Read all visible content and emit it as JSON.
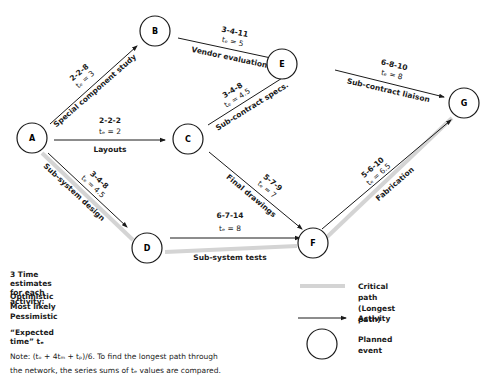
{
  "nodes": [
    {
      "id": "A",
      "label": "A"
    },
    {
      "id": "B",
      "label": "B"
    },
    {
      "id": "C",
      "label": "C"
    },
    {
      "id": "D",
      "label": "D"
    },
    {
      "id": "E",
      "label": "E"
    },
    {
      "id": "F",
      "label": "F"
    },
    {
      "id": "G",
      "label": "G"
    }
  ],
  "activities": {
    "ab": {
      "name": "Special component study",
      "estimates": "2-2-8",
      "te": "tₑ = 3"
    },
    "ac": {
      "name": "Layouts",
      "estimates": "2-2-2",
      "te": "tₑ = 2"
    },
    "ad": {
      "name": "Sub-system design",
      "estimates": "3-4-8",
      "te": "tₑ = 4.5"
    },
    "be": {
      "name": "Vendor evaluation",
      "estimates": "3-4-11",
      "te": "tₑ = 5"
    },
    "ce": {
      "name": "Sub-contract specs.",
      "estimates": "3-4-8",
      "te": "tₑ = 4.5"
    },
    "cf": {
      "name": "Final drawings",
      "estimates": "5-7-9",
      "te": "tₑ = 7"
    },
    "df": {
      "name": "Sub-system tests",
      "estimates": "6-7-14",
      "te": "tₑ = 8"
    },
    "eg": {
      "name": "Sub-contract liaison",
      "estimates": "6-8-10",
      "te": "tₑ = 8"
    },
    "fg": {
      "name": "Fabrication",
      "estimates": "5-6-10",
      "te": "tₑ = 6.5"
    }
  },
  "critical_path": [
    "A",
    "D",
    "F",
    "G"
  ],
  "estimates_info": {
    "title": "3 Time estimates for each activity:",
    "optimistic": "Optimistic",
    "most_likely": "Most likely",
    "pessimistic": "Pessimistic",
    "expected": "“Expected time” tₑ",
    "note_line1": "Note: (tₒ + 4tₘ + tₚ)/6. To find the longest path through",
    "note_line2": "the network, the  series  sums of tₑ values are compared."
  },
  "legend": {
    "critical_path": "Critical path",
    "critical_path_sub": "(Longest path)",
    "activity": "Activity",
    "planned_event": "Planned event"
  },
  "colors": {
    "critical": "#d4d4d4",
    "line": "#1a1a1a"
  }
}
